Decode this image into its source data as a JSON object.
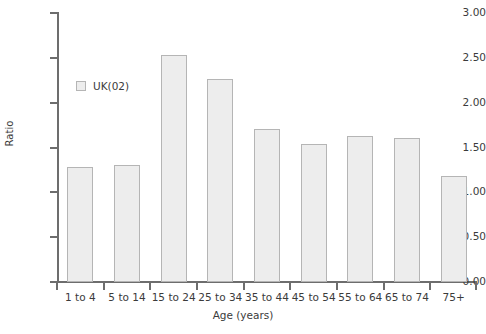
{
  "chart_data": {
    "type": "bar",
    "title": "",
    "subtitle": "",
    "xlabel": "Age (years)",
    "ylabel": "Ratio",
    "categories": [
      "1 to 4",
      "5 to 14",
      "15 to 24",
      "25 to 34",
      "35 to 44",
      "45 to 54",
      "55 to 64",
      "65 to 74",
      "75+"
    ],
    "series": [
      {
        "name": "UK(02)",
        "values": [
          1.28,
          1.31,
          2.53,
          2.26,
          1.71,
          1.54,
          1.63,
          1.61,
          1.18
        ]
      }
    ],
    "ylim": [
      0.0,
      3.0
    ],
    "ytick_labels": [
      "0.00",
      "0.50",
      "1.00",
      "1.50",
      "2.00",
      "2.50",
      "3.00"
    ],
    "ytick_values": [
      0.0,
      0.5,
      1.0,
      1.5,
      2.0,
      2.5,
      3.0
    ],
    "grid": false,
    "legend": {
      "position": "inside-upper-left",
      "entries": [
        {
          "label": "UK(02)",
          "swatch_fill": "#ededed",
          "swatch_border": "#b5b5b5"
        }
      ]
    },
    "style": {
      "bar_fill": "#ededed",
      "bar_border": "#b5b5b5",
      "axis_color": "#6d6d6d",
      "text_color": "#3b3b3b",
      "background": "#ffffff"
    }
  }
}
